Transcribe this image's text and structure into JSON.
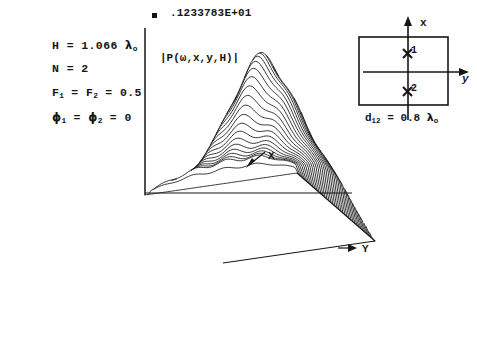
{
  "figure": {
    "peak_value_label": ".1233783E+01",
    "z_axis_label": "|P(ω,x,y,H)|",
    "x_axis_label": "X",
    "y_axis_label": "Y",
    "marker_icon": "filled-square-marker"
  },
  "parameters": {
    "height": {
      "symbol": "H",
      "eq": "=",
      "value": "1.066",
      "unit": "λ",
      "unit_sub": "o"
    },
    "count": {
      "symbol": "N",
      "eq": "=",
      "value": "2"
    },
    "amplitudes": {
      "symbol1": "F",
      "sub1": "1",
      "eq1": "=",
      "symbol2": "F",
      "sub2": "2",
      "eq2": "=",
      "value": "0.5"
    },
    "phases": {
      "symbol1": "ϕ",
      "sub1": "1",
      "eq1": "=",
      "symbol2": "ϕ",
      "sub2": "2",
      "eq2": "=",
      "value": "0"
    }
  },
  "inset": {
    "x_axis_label": "x",
    "y_axis_label": "y",
    "point1_label": "1",
    "point2_label": "2",
    "point_marker_icon": "x-cross-marker",
    "separation": {
      "symbol": "d",
      "sub": "12",
      "eq": "=",
      "value": "0.8",
      "unit": "λ",
      "unit_sub": "o"
    }
  },
  "colors": {
    "ink": "#161616",
    "paper": "#ffffff"
  },
  "chart_data": {
    "type": "line",
    "render": "3d-wireframe-surface-hidden-line",
    "title": "",
    "subtitle": "",
    "xlabel": "X",
    "ylabel": "Y",
    "zlabel": "|P(ω,x,y,H)|",
    "zmax_label": ".1233783E+01",
    "zmax": 1.233783,
    "zmin": 0,
    "grid": false,
    "legend": null,
    "annotations": [
      "H = 1.066 λₒ",
      "N = 2",
      "F₁ = F₂ = 0.5",
      "ϕ₁ = ϕ₂ = 0",
      "d₁₂ = 0.8 λₒ"
    ],
    "n_traces": 40,
    "n_samples_per_trace": 96,
    "x": [
      -2.0,
      2.0
    ],
    "y": [
      -2.0,
      2.0
    ],
    "surface_model": {
      "description": "Magnitude of the field of two in-phase sources separated by d12 along x, observed at height H",
      "peak_center_x": 0.04,
      "peak_center_y": 0.0,
      "main_lobe_sigma_x": 0.62,
      "main_lobe_sigma_y": 0.74,
      "secondary_ridge_offset": 1.15,
      "secondary_ridge_amplitude": 0.34,
      "ripple_amplitude": 0.035,
      "ripple_frequency": 7.5
    }
  }
}
